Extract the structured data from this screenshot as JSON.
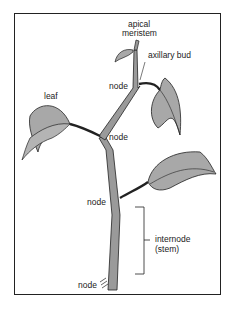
{
  "diagram": {
    "labels": {
      "apical_meristem_1": "apical",
      "apical_meristem_2": "meristem",
      "axillary_bud": "axillary bud",
      "leaf": "leaf",
      "node_top": "node",
      "node_mid": "node",
      "node_lower": "node",
      "node_bottom": "node",
      "internode_1": "internode",
      "internode_2": "(stem)"
    },
    "colors": {
      "stem": "#9a9a9a",
      "leaf": "#a8a8a8",
      "outline": "#222222",
      "background": "#ffffff"
    }
  }
}
